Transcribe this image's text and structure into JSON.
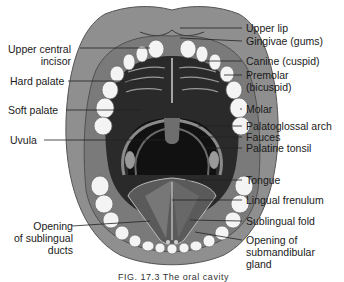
{
  "figure": {
    "caption": "FIG. 17.3   The oral cavity",
    "colors": {
      "lip": "#8f8f8f",
      "lip_inner": "#a8a8a8",
      "gum": "#7a7a7a",
      "teeth": "#f4f4f4",
      "palate": "#2a2a2a",
      "throat": "#111111",
      "tongue": "#5a5a5a",
      "tongue_light": "#7e7e7e",
      "leader_line": "#222222"
    }
  },
  "labels": {
    "left": [
      {
        "id": "upper-central-incisor",
        "text": "Upper central",
        "text2": "incisor"
      },
      {
        "id": "hard-palate",
        "text": "Hard palate"
      },
      {
        "id": "soft-palate",
        "text": "Soft palate"
      },
      {
        "id": "uvula",
        "text": "Uvula"
      },
      {
        "id": "opening-sublingual-ducts",
        "text": "Opening",
        "text2": "of sublingual",
        "text3": "ducts"
      }
    ],
    "right": [
      {
        "id": "upper-lip",
        "text": "Upper lip"
      },
      {
        "id": "gingivae",
        "text": "Gingivae (gums)"
      },
      {
        "id": "canine",
        "text": "Canine (cuspid)"
      },
      {
        "id": "premolar",
        "text": "Premolar",
        "text2": "(bicuspid)"
      },
      {
        "id": "molar",
        "text": "Molar"
      },
      {
        "id": "palatoglossal-arch",
        "text": "Palatoglossal arch"
      },
      {
        "id": "fauces",
        "text": "Fauces"
      },
      {
        "id": "palatine-tonsil",
        "text": "Palatine tonsil"
      },
      {
        "id": "tongue",
        "text": "Tongue"
      },
      {
        "id": "lingual-frenulum",
        "text": "Lingual frenulum"
      },
      {
        "id": "sublingual-fold",
        "text": "Sublingual fold"
      },
      {
        "id": "opening-submandibular-gland",
        "text": "Opening of",
        "text2": "submandibular",
        "text3": "gland"
      }
    ]
  }
}
